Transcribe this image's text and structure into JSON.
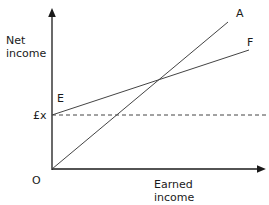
{
  "diagram": {
    "y_axis_label_line1": "Net",
    "y_axis_label_line2": "income",
    "x_axis_label_line1": "Earned",
    "x_axis_label_line2": "income",
    "origin_label": "O",
    "intercept_label": "£x",
    "point_e_label": "E",
    "line_a_label": "A",
    "line_f_label": "F",
    "line_color": "#3a3a3a"
  }
}
